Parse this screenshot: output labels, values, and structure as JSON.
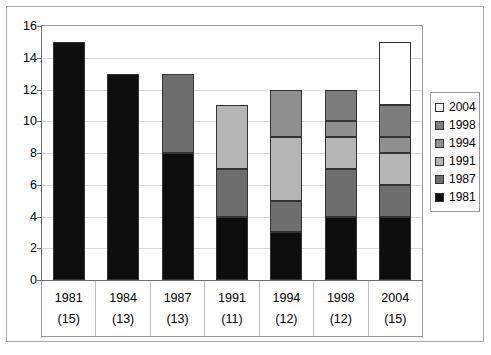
{
  "chart_data": {
    "type": "bar",
    "subtype": "stacked-vertical",
    "title": "",
    "xlabel": "",
    "ylabel": "",
    "ylim": [
      0,
      16
    ],
    "ytick_step": 2,
    "yticks": [
      16,
      14,
      12,
      10,
      8,
      6,
      4,
      2,
      0
    ],
    "grid": true,
    "legend_position": "right",
    "categories": [
      "1981",
      "1984",
      "1987",
      "1991",
      "1994",
      "1998",
      "2004"
    ],
    "category_sublabels": [
      "(15)",
      "(13)",
      "(13)",
      "(11)",
      "(12)",
      "(12)",
      "(15)"
    ],
    "series": [
      {
        "name": "1981",
        "color": "#0d0d0d",
        "values": [
          15,
          13,
          8,
          4,
          3,
          4,
          4
        ]
      },
      {
        "name": "1987",
        "color": "#6e6e6e",
        "values": [
          0,
          0,
          5,
          3,
          2,
          3,
          2
        ]
      },
      {
        "name": "1991",
        "color": "#b5b5b5",
        "values": [
          0,
          0,
          0,
          4,
          4,
          2,
          2
        ]
      },
      {
        "name": "1994",
        "color": "#8f8f8f",
        "values": [
          0,
          0,
          0,
          0,
          3,
          1,
          1
        ]
      },
      {
        "name": "1998",
        "color": "#7d7d7d",
        "values": [
          0,
          0,
          0,
          0,
          0,
          2,
          2
        ]
      },
      {
        "name": "2004",
        "color": "#ffffff",
        "values": [
          0,
          0,
          0,
          0,
          0,
          0,
          4
        ]
      }
    ],
    "totals": [
      15,
      13,
      13,
      11,
      12,
      12,
      15
    ],
    "legend_order": [
      "2004",
      "1998",
      "1994",
      "1991",
      "1987",
      "1981"
    ]
  },
  "legend": {
    "entries": [
      {
        "label": "2004",
        "color": "#ffffff"
      },
      {
        "label": "1998",
        "color": "#7d7d7d"
      },
      {
        "label": "1994",
        "color": "#8f8f8f"
      },
      {
        "label": "1991",
        "color": "#b5b5b5"
      },
      {
        "label": "1987",
        "color": "#6e6e6e"
      },
      {
        "label": "1981",
        "color": "#0d0d0d"
      }
    ]
  }
}
